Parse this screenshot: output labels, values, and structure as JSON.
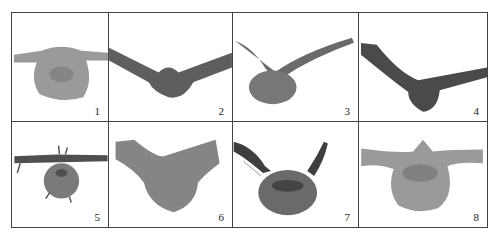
{
  "figure": {
    "panels": [
      {
        "label": "1",
        "description": "leaf cross-section, wide pale midrib, flat blades"
      },
      {
        "label": "2",
        "description": "leaf cross-section, V-shaped dark blades, small midrib"
      },
      {
        "label": "3",
        "description": "leaf cross-section, thin upward blades, oval midrib"
      },
      {
        "label": "4",
        "description": "leaf cross-section, asymmetric dark blades"
      },
      {
        "label": "5",
        "description": "leaf cross-section, flat blades, round midrib with trichomes"
      },
      {
        "label": "6",
        "description": "leaf cross-section, thick wing-like blades, large midrib"
      },
      {
        "label": "7",
        "description": "leaf cross-section, dark upright blades, round midrib"
      },
      {
        "label": "8",
        "description": "leaf cross-section, pale flat blades, large round midrib"
      }
    ],
    "colors": {
      "border": "#444444",
      "tissue_light": "#9a9a9a",
      "tissue_mid": "#7a7a7a",
      "tissue_dark": "#4a4a4a"
    }
  }
}
